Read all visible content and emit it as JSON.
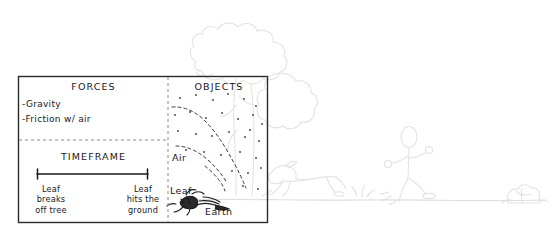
{
  "diagram": {
    "title_visible": false,
    "panels": [
      {
        "id": "forces",
        "header": "FORCES",
        "items": [
          "-Gravity",
          "-Friction w/ air"
        ]
      },
      {
        "id": "timeframe",
        "header": "TIMEFRAME",
        "start_label": "Leaf\nbreaks\noff tree",
        "end_label": "Leaf\nhits the\nground"
      },
      {
        "id": "objects",
        "header": "OBJECTS",
        "set_labels": [
          "Air",
          "Leaf",
          "Earth"
        ]
      }
    ]
  },
  "background_scene": {
    "elements": [
      "tree",
      "running-dog",
      "running-stick-figure",
      "bush",
      "ground-line"
    ]
  },
  "colors": {
    "ink": "#191919",
    "frame": "#2b2b2b",
    "divider": "#8a8a8a",
    "background_sketch": "#e3e3e3",
    "page": "#ffffff"
  }
}
